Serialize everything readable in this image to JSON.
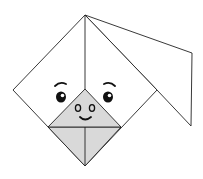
{
  "illustration": {
    "subject": "origami-dog-face",
    "colors": {
      "background": "#ffffff",
      "stroke": "#222222",
      "shade": "#d9d9d9",
      "eye": "#111111"
    }
  }
}
